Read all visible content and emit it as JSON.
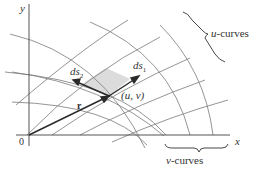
{
  "figure": {
    "axes": {
      "y_label": "y",
      "x_label": "x",
      "origin_label": "0"
    },
    "vectors": {
      "r_label": "r",
      "ds1_label_main": "ds",
      "ds1_label_sub": "1",
      "ds2_label_main": "ds",
      "ds2_label_sub": "2"
    },
    "point_label": "(u, v)",
    "braces": {
      "u_curves_var": "u",
      "u_curves_text": "-curves",
      "v_curves_var": "v",
      "v_curves_text": "-curves"
    },
    "colors": {
      "line": "#6e6e6e",
      "axis": "#555555",
      "vector": "#2a2a2a",
      "patch_fill": "#dcdcdc",
      "text": "#333333"
    }
  }
}
